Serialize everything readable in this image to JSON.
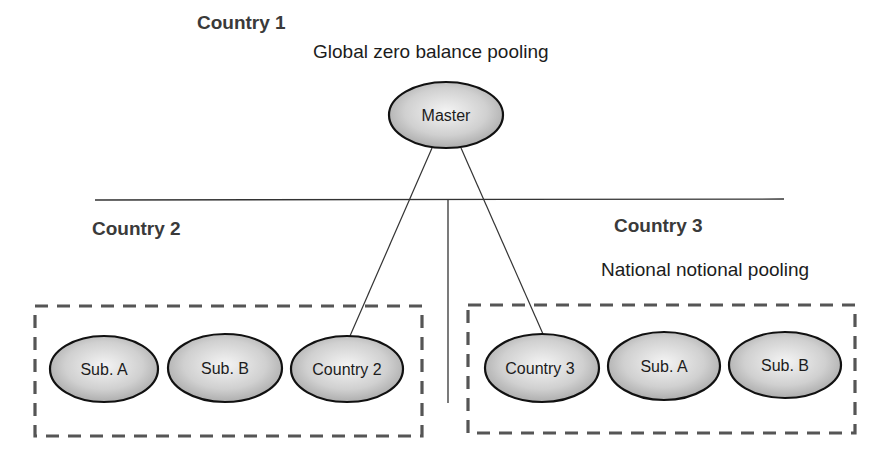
{
  "diagram": {
    "type": "cash-pooling-structure",
    "country1": {
      "label": "Country 1",
      "pooling_type": "Global zero balance  pooling",
      "master_node": "Master"
    },
    "country2": {
      "label": "Country 2",
      "nodes": [
        "Sub. A",
        "Sub. B",
        "Country 2"
      ]
    },
    "country3": {
      "label": "Country 3",
      "pooling_type": "National notional pooling",
      "nodes": [
        "Country 3",
        "Sub. A",
        "Sub. B"
      ]
    },
    "connections": [
      {
        "from": "Master",
        "to": "Country 2"
      },
      {
        "from": "Master",
        "to": "Country 3"
      }
    ],
    "colors": {
      "node_fill_light": "#f2f2f2",
      "node_fill_dark": "#a8a8a8",
      "node_stroke": "#111111",
      "dashed_border": "#555555",
      "line": "#333333"
    }
  }
}
